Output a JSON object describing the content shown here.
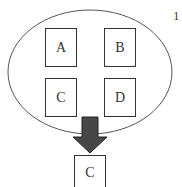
{
  "diagram": {
    "figure_number": "1",
    "set": {
      "shape": "ellipse",
      "items": [
        {
          "label": "A"
        },
        {
          "label": "B"
        },
        {
          "label": "C"
        },
        {
          "label": "D"
        }
      ]
    },
    "arrow": {
      "direction": "down",
      "fill": "#474747",
      "stroke": "#222222"
    },
    "result": {
      "label": "C"
    }
  }
}
